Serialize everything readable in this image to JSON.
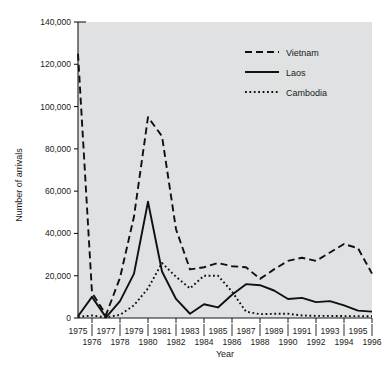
{
  "chart_data": {
    "type": "line",
    "title": "",
    "xlabel": "Year",
    "ylabel": "Number of arrivals",
    "xlim": [
      1975,
      1996
    ],
    "ylim": [
      0,
      140000
    ],
    "yticks": [
      0,
      20000,
      40000,
      60000,
      80000,
      100000,
      120000,
      140000
    ],
    "ytick_labels": [
      "0",
      "20,000",
      "40,000",
      "60,000",
      "80,000",
      "100,000",
      "120,000",
      "140,000"
    ],
    "x": [
      1975,
      1976,
      1977,
      1978,
      1979,
      1980,
      1981,
      1982,
      1983,
      1984,
      1985,
      1986,
      1987,
      1988,
      1989,
      1990,
      1991,
      1992,
      1993,
      1994,
      1995,
      1996
    ],
    "xtick_labels_top": [
      "1975",
      "1977",
      "1979",
      "1981",
      "1983",
      "1985",
      "1987",
      "1989",
      "1991",
      "1993",
      "1995"
    ],
    "xtick_labels_bottom": [
      "1976",
      "1978",
      "1980",
      "1982",
      "1984",
      "1986",
      "1988",
      "1990",
      "1992",
      "1994",
      "1996"
    ],
    "grid": false,
    "legend_position": "upper right",
    "plot_background": "#dfe1e2",
    "series": [
      {
        "name": "Vietnam",
        "style": "dashed",
        "color": "#101010",
        "values": [
          125000,
          12000,
          1500,
          19000,
          48000,
          95000,
          86000,
          42000,
          23000,
          24000,
          26000,
          24500,
          24000,
          18500,
          23000,
          27000,
          28500,
          27000,
          31000,
          35000,
          33000,
          21000
        ]
      },
      {
        "name": "Laos",
        "style": "solid",
        "color": "#101010",
        "values": [
          800,
          10000,
          300,
          8000,
          21000,
          55000,
          22000,
          9000,
          2000,
          6500,
          5000,
          11000,
          16000,
          15500,
          13000,
          9000,
          9500,
          7500,
          8000,
          6000,
          3500,
          3000
        ]
      },
      {
        "name": "Cambodia",
        "style": "dotted",
        "color": "#101010",
        "values": [
          500,
          1200,
          300,
          1500,
          6000,
          14000,
          26000,
          19500,
          14000,
          20000,
          20000,
          12500,
          3000,
          1800,
          2000,
          2000,
          1200,
          1000,
          1000,
          900,
          900,
          800
        ]
      }
    ]
  },
  "legend": {
    "items": [
      {
        "label": "Vietnam",
        "style": "dashed"
      },
      {
        "label": "Laos",
        "style": "solid"
      },
      {
        "label": "Cambodia",
        "style": "dotted"
      }
    ]
  }
}
